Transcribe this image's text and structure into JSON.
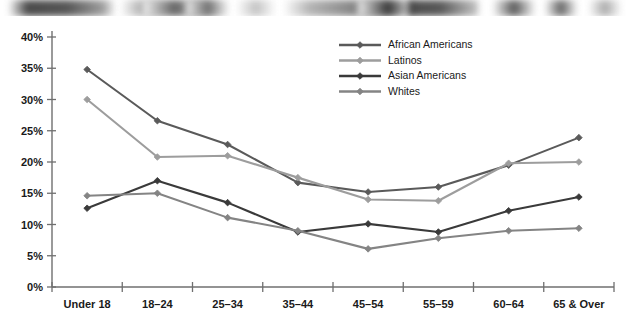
{
  "figure": {
    "width": 627,
    "height": 313,
    "background": "#ffffff",
    "scan_artifact_label": "scanned-page-edge-smudge"
  },
  "chart_data": {
    "type": "line",
    "title": "",
    "subtitle": "",
    "xlabel": "",
    "ylabel": "",
    "categories": [
      "Under 18",
      "18–24",
      "25–34",
      "35–44",
      "45–54",
      "55–59",
      "60–64",
      "65 & Over"
    ],
    "ytick_labels": [
      "0%",
      "5%",
      "10%",
      "15%",
      "20%",
      "25%",
      "30%",
      "35%",
      "40%"
    ],
    "ytick_values": [
      0,
      5,
      10,
      15,
      20,
      25,
      30,
      35,
      40
    ],
    "ylim": [
      0,
      40
    ],
    "y_tick_suffix": "%",
    "grid": false,
    "legend_position": "top-center-right",
    "series": [
      {
        "name": "African Americans",
        "color": "#5a5a5a",
        "marker": "diamond",
        "values": [
          34.8,
          26.6,
          22.8,
          16.7,
          15.2,
          16.0,
          19.5,
          23.9
        ]
      },
      {
        "name": "Latinos",
        "color": "#9d9d9d",
        "marker": "diamond",
        "values": [
          30.0,
          20.8,
          21.0,
          17.5,
          14.0,
          13.8,
          19.8,
          20.0
        ]
      },
      {
        "name": "Asian Americans",
        "color": "#3a3a3a",
        "marker": "diamond",
        "values": [
          12.6,
          17.0,
          13.5,
          8.8,
          10.1,
          8.8,
          12.2,
          14.4
        ]
      },
      {
        "name": "Whites",
        "color": "#848484",
        "marker": "diamond",
        "values": [
          14.6,
          15.0,
          11.1,
          9.0,
          6.1,
          7.8,
          9.0,
          9.4
        ]
      }
    ]
  }
}
